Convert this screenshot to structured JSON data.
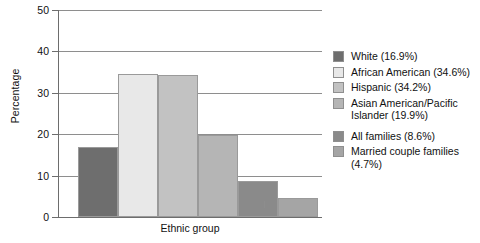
{
  "chart_data": {
    "type": "bar",
    "title": "",
    "xlabel": "Ethnic group",
    "ylabel": "Percentage",
    "ylim": [
      0,
      50
    ],
    "ytick_labels": [
      "50",
      "40",
      "30",
      "20",
      "10",
      "0"
    ],
    "ytick_values": [
      50,
      40,
      30,
      20,
      10,
      0
    ],
    "grid": true,
    "legend_position": "right",
    "categories": [
      "White",
      "African American",
      "Hispanic",
      "Asian American/Pacific Islander",
      "All families",
      "Married couple families"
    ],
    "values": [
      16.9,
      34.6,
      34.2,
      19.9,
      8.6,
      4.7
    ],
    "colors": [
      "#6e6e6e",
      "#e8e8e8",
      "#c2c2c2",
      "#b5b5b5",
      "#8a8a8a",
      "#a5a5a5"
    ],
    "legend": [
      {
        "label": "White (16.9%)",
        "color": "#6e6e6e"
      },
      {
        "label": "African American (34.6%)",
        "color": "#e8e8e8"
      },
      {
        "label": "Hispanic (34.2%)",
        "color": "#c2c2c2"
      },
      {
        "label": "Asian American/Pacific Islander (19.9%)",
        "color": "#b5b5b5"
      },
      {
        "label": "All families (8.6%)",
        "color": "#8a8a8a"
      },
      {
        "label": "Married couple families (4.7%)",
        "color": "#a5a5a5"
      }
    ]
  }
}
